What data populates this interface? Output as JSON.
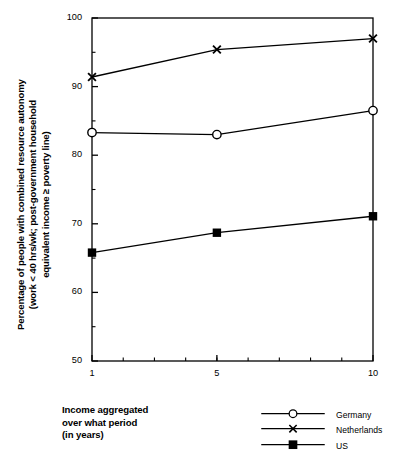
{
  "chart_data": {
    "type": "line",
    "title": "",
    "xlabel": "Income aggregated over what period (in years)",
    "ylabel": "Percentage of people with combined resource autonomy (work < 40 hrs/wk; post-government household equivalent income ≥ poverty line)",
    "x": [
      1,
      5,
      10
    ],
    "xlim": [
      1,
      10
    ],
    "ylim": [
      50,
      100
    ],
    "xticks": [
      1,
      5,
      10
    ],
    "xtick_labels": [
      "1",
      "5",
      "10"
    ],
    "xminor_ticks": [
      2,
      3,
      4,
      5,
      6,
      7,
      8,
      9
    ],
    "yticks": [
      50,
      60,
      70,
      80,
      90,
      100
    ],
    "ytick_labels": [
      "50",
      "60",
      "70",
      "80",
      "90",
      "100"
    ],
    "yminor_ticks": [
      55,
      65,
      75,
      85,
      95
    ],
    "grid": false,
    "legend_position": "bottom-right",
    "series": [
      {
        "name": "Germany",
        "marker": "open-circle",
        "values": [
          83.3,
          83.0,
          86.5
        ]
      },
      {
        "name": "Netherlands",
        "marker": "x-cross",
        "values": [
          91.4,
          95.4,
          97.0
        ]
      },
      {
        "name": "US",
        "marker": "filled-square",
        "values": [
          65.8,
          68.7,
          71.1
        ]
      }
    ]
  },
  "axes": {
    "y_title_lines": [
      "Percentage of people with combined resource autonomy",
      "(work < 40 hrs/wk; post-government household",
      "equivalent income ≥ poverty line)"
    ],
    "x_title_lines": [
      "Income aggregated",
      "over what period",
      "(in years)"
    ]
  },
  "legend": {
    "items": [
      {
        "label": "Germany",
        "marker": "open-circle"
      },
      {
        "label": "Netherlands",
        "marker": "x-cross"
      },
      {
        "label": "US",
        "marker": "filled-square"
      }
    ]
  },
  "colors": {
    "line": "#000000",
    "axis": "#000000",
    "background": "#ffffff"
  }
}
